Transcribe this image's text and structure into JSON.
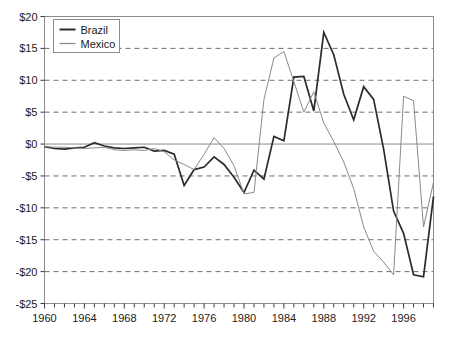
{
  "chart_data": {
    "type": "line",
    "title": "",
    "subtitle": "",
    "xlabel": "",
    "ylabel": "",
    "xlim": [
      1960,
      1999
    ],
    "ylim": [
      -25,
      20
    ],
    "ytick_step": 5,
    "xtick_step": 1,
    "xlabel_step": 4,
    "grid": true,
    "grid_axis": "y",
    "legend_position": "top-left",
    "y_tick_labels": [
      "$20",
      "$15",
      "$10",
      "$5",
      "$0",
      "-$5",
      "-$10",
      "-$15",
      "-$20",
      "-$25"
    ],
    "y_tick_values": [
      20,
      15,
      10,
      5,
      0,
      -5,
      -10,
      -15,
      -20,
      -25
    ],
    "x_tick_labels": [
      "1960",
      "1964",
      "1968",
      "1972",
      "1976",
      "1980",
      "1984",
      "1988",
      "1992",
      "1996"
    ],
    "x_tick_label_values": [
      1960,
      1964,
      1968,
      1972,
      1976,
      1980,
      1984,
      1988,
      1992,
      1996
    ],
    "x": [
      1960,
      1961,
      1962,
      1963,
      1964,
      1965,
      1966,
      1967,
      1968,
      1969,
      1970,
      1971,
      1972,
      1973,
      1974,
      1975,
      1976,
      1977,
      1978,
      1979,
      1980,
      1981,
      1982,
      1983,
      1984,
      1985,
      1986,
      1987,
      1988,
      1989,
      1990,
      1991,
      1992,
      1993,
      1994,
      1995,
      1996,
      1997,
      1998,
      1999
    ],
    "series": [
      {
        "name": "Brazil",
        "color": "#2b2b2b",
        "width": 1.7,
        "values": [
          -0.4,
          -0.7,
          -0.8,
          -0.6,
          -0.5,
          0.2,
          -0.3,
          -0.6,
          -0.7,
          -0.6,
          -0.5,
          -1.1,
          -1.0,
          -1.6,
          -6.5,
          -4.0,
          -3.6,
          -2.0,
          -3.2,
          -5.2,
          -7.6,
          -4.1,
          -5.5,
          1.2,
          0.5,
          10.5,
          10.6,
          5.2,
          17.5,
          14.0,
          7.8,
          3.8,
          9.0,
          7.0,
          -0.8,
          -10.5,
          -14.0,
          -20.5,
          -20.8,
          -8.2
        ]
      },
      {
        "name": "Mexico",
        "color": "#8a8a8a",
        "width": 1.0,
        "values": [
          -0.4,
          -0.5,
          -0.5,
          -0.6,
          -0.7,
          -0.6,
          -0.5,
          -0.9,
          -1.0,
          -0.9,
          -1.0,
          -0.7,
          -1.2,
          -2.5,
          -3.2,
          -4.0,
          -1.6,
          1.0,
          -0.7,
          -3.4,
          -7.8,
          -7.6,
          7.0,
          13.5,
          14.5,
          9.8,
          5.0,
          8.2,
          3.3,
          0.4,
          -2.8,
          -7.0,
          -13.0,
          -16.8,
          -18.5,
          -20.5,
          7.5,
          6.8,
          -13.0,
          -6.0
        ]
      }
    ]
  },
  "legend": {
    "items": [
      {
        "label": "Brazil"
      },
      {
        "label": "Mexico"
      }
    ]
  }
}
